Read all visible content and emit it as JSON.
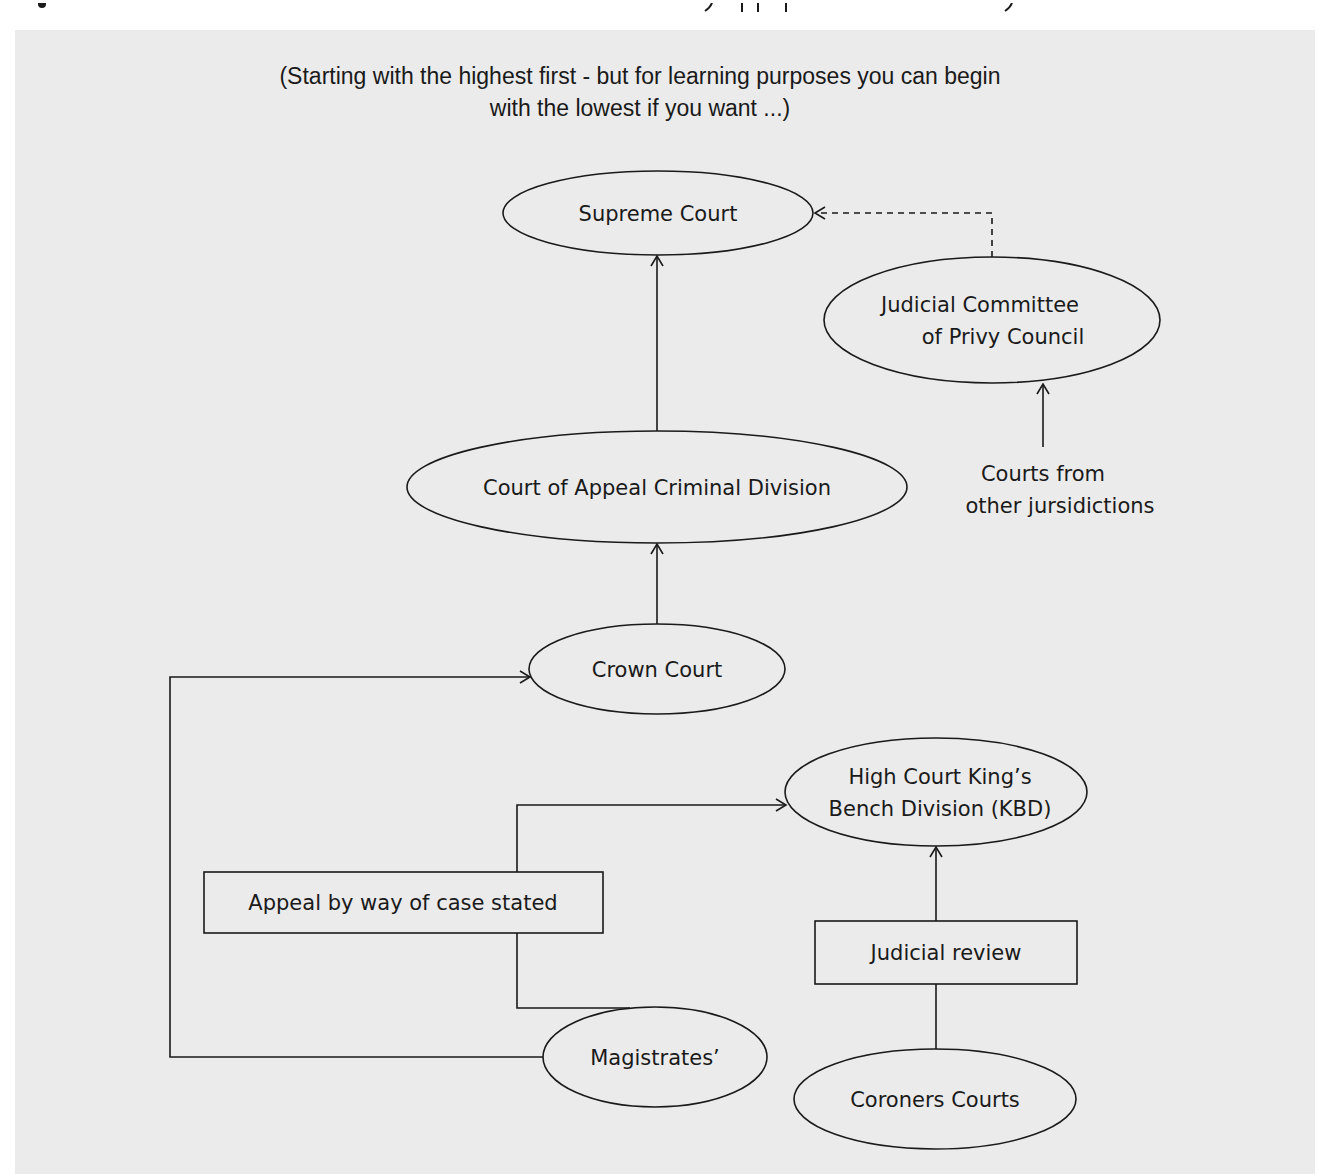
{
  "header": {
    "line1": "(Starting with the highest first - but for learning purposes you can begin",
    "line2": "with the lowest if you want ...)"
  },
  "nodes": {
    "supreme_court": {
      "label": "Supreme Court",
      "shape": "ellipse"
    },
    "judicial_committee": {
      "line1": "Judicial Committee",
      "line2": "of Privy Council",
      "shape": "ellipse"
    },
    "other_jurisdictions": {
      "line1": "Courts from",
      "line2": "other jursidictions",
      "shape": "text"
    },
    "court_of_appeal": {
      "label": "Court of Appeal Criminal Division",
      "shape": "ellipse"
    },
    "crown_court": {
      "label": "Crown Court",
      "shape": "ellipse"
    },
    "high_court_kbd": {
      "line1": "High Court King’s",
      "line2": "Bench Division (KBD)",
      "shape": "ellipse"
    },
    "appeal_case_stated": {
      "label": "Appeal by way of case stated",
      "shape": "rect"
    },
    "judicial_review": {
      "label": "Judicial review",
      "shape": "rect"
    },
    "magistrates": {
      "label": "Magistrates’",
      "shape": "ellipse"
    },
    "coroners_courts": {
      "label": "Coroners Courts",
      "shape": "ellipse"
    }
  },
  "edges": [
    {
      "from": "judicial_committee",
      "to": "supreme_court",
      "style": "dashed"
    },
    {
      "from": "court_of_appeal",
      "to": "supreme_court",
      "style": "solid"
    },
    {
      "from": "other_jurisdictions",
      "to": "judicial_committee",
      "style": "solid"
    },
    {
      "from": "crown_court",
      "to": "court_of_appeal",
      "style": "solid"
    },
    {
      "from": "magistrates",
      "to": "crown_court",
      "style": "solid"
    },
    {
      "from": "magistrates",
      "to": "high_court_kbd",
      "via": "appeal_case_stated",
      "style": "solid"
    },
    {
      "from": "coroners_courts",
      "to": "high_court_kbd",
      "via": "judicial_review",
      "style": "solid"
    }
  ],
  "colors": {
    "panel_background": "#ebebeb",
    "page_background": "#ffffff",
    "stroke": "#1a1a1a"
  }
}
